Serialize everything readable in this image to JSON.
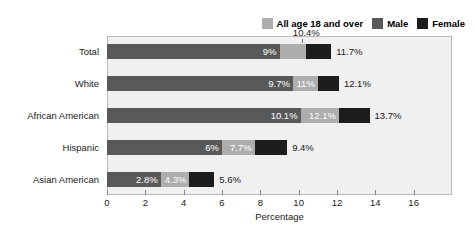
{
  "chart_data": {
    "type": "bar",
    "orientation": "horizontal",
    "title": "",
    "xlabel": "Percentage",
    "ylabel": "",
    "xlim": [
      0,
      18
    ],
    "xticks": [
      0,
      2,
      4,
      6,
      8,
      10,
      12,
      14,
      16
    ],
    "xtick_labels": [
      "0",
      "2",
      "4",
      "6",
      "8",
      "10",
      "12",
      "14",
      "16"
    ],
    "grid": false,
    "legend_position": "top-right",
    "categories": [
      "Total",
      "White",
      "African American",
      "Hispanic",
      "Asian American"
    ],
    "series": [
      {
        "name": "All age 18 and over",
        "color": "#adadad",
        "values": [
          10.4,
          11,
          12.1,
          7.7,
          4.3
        ],
        "labels": [
          "10.4%",
          "11%",
          "12.1%",
          "7.7%",
          "4.3%"
        ]
      },
      {
        "name": "Male",
        "color": "#595959",
        "values": [
          9,
          9.7,
          10.1,
          6,
          2.8
        ],
        "labels": [
          "9%",
          "9.7%",
          "10.1%",
          "6%",
          "2.8%"
        ]
      },
      {
        "name": "Female",
        "color": "#1c1c1c",
        "values": [
          11.7,
          12.1,
          13.7,
          9.4,
          5.6
        ],
        "labels": [
          "11.7%",
          "12.1%",
          "13.7%",
          "9.4%",
          "5.6%"
        ]
      }
    ]
  },
  "legend": {
    "entries": [
      {
        "label": "All age 18 and over",
        "color": "#adadad"
      },
      {
        "label": "Male",
        "color": "#595959"
      },
      {
        "label": "Female",
        "color": "#1c1c1c"
      }
    ]
  },
  "axis": {
    "x_title": "Percentage",
    "tick_labels": [
      "0",
      "2",
      "4",
      "6",
      "8",
      "10",
      "12",
      "14",
      "16"
    ]
  },
  "categories": [
    "Total",
    "White",
    "African American",
    "Hispanic",
    "Asian American"
  ]
}
